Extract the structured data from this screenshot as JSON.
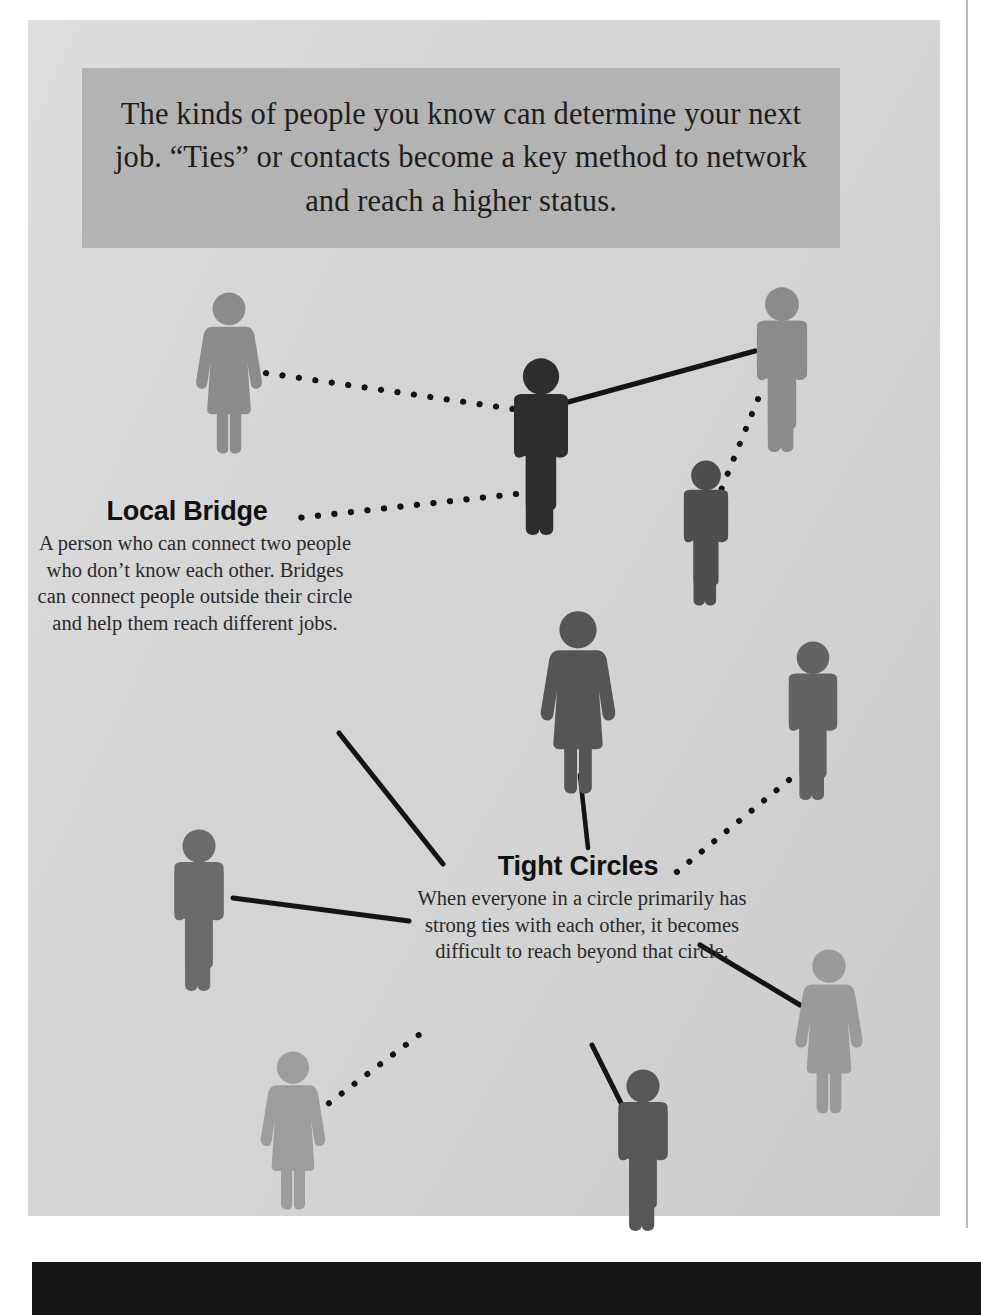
{
  "page": {
    "background_color": "#d4d4d4",
    "accent_band_color": "#b3b3b3",
    "footer_band_color": "#151515"
  },
  "header": {
    "text": "The kinds of people you know can determine your next job. “Ties” or contacts become a key method to network and reach a higher status."
  },
  "callouts": [
    {
      "id": "local-bridge",
      "heading": "Local Bridge",
      "body": "A person who can connect two people who don’t know each other. Bridges can connect people outside their circle and help them reach different jobs."
    },
    {
      "id": "tight-circles",
      "heading": "Tight Circles",
      "body": "When everyone in a circle primarily has strong ties with each other, it becomes difficult to reach beyond that circle."
    }
  ],
  "diagram": {
    "type": "node-link-network",
    "legend": {
      "solid_line": "strong tie",
      "dotted_line": "weak tie"
    },
    "nodes": [
      {
        "id": "n1",
        "gender": "female",
        "x": 229,
        "y": 310,
        "height": 128,
        "color": "#8b8b8b",
        "group": "outside-left"
      },
      {
        "id": "n2",
        "gender": "male",
        "x": 541,
        "y": 385,
        "height": 150,
        "color": "#2e2e2e",
        "group": "bridge"
      },
      {
        "id": "n3",
        "gender": "male",
        "x": 782,
        "y": 303,
        "height": 138,
        "color": "#8b8b8b",
        "group": "upper-right"
      },
      {
        "id": "n4",
        "gender": "male",
        "x": 706,
        "y": 485,
        "height": 120,
        "color": "#4e4e4e",
        "group": "upper-right"
      },
      {
        "id": "n5",
        "gender": "female",
        "x": 578,
        "y": 643,
        "height": 150,
        "color": "#555555",
        "group": "tight-circle"
      },
      {
        "id": "n6",
        "gender": "male",
        "x": 813,
        "y": 667,
        "height": 134,
        "color": "#636363",
        "group": "tight-circle"
      },
      {
        "id": "n7",
        "gender": "male",
        "x": 199,
        "y": 855,
        "height": 136,
        "color": "#6b6b6b",
        "group": "tight-circle"
      },
      {
        "id": "n8",
        "gender": "female",
        "x": 829,
        "y": 975,
        "height": 134,
        "color": "#9a9a9a",
        "group": "tight-circle"
      },
      {
        "id": "n9",
        "gender": "female",
        "x": 293,
        "y": 1076,
        "height": 130,
        "color": "#9d9d9d",
        "group": "outside-bottom"
      },
      {
        "id": "n10",
        "gender": "male",
        "x": 643,
        "y": 1094,
        "height": 136,
        "color": "#575757",
        "group": "tight-circle"
      }
    ],
    "edges": [
      {
        "from": "n1",
        "to": "n2",
        "style": "dotted",
        "tie": "weak"
      },
      {
        "from": "n2",
        "to": "n3",
        "style": "solid",
        "tie": "strong"
      },
      {
        "from": "n3",
        "to": "n4",
        "style": "dotted",
        "tie": "weak"
      },
      {
        "from": "n2",
        "to": "local-bridge-label",
        "style": "dotted",
        "tie": "weak"
      },
      {
        "from": "local-bridge-text",
        "to": "tight-circles-label",
        "style": "solid",
        "tie": "strong"
      },
      {
        "from": "n5",
        "to": "tight-circles-label",
        "style": "solid",
        "tie": "strong"
      },
      {
        "from": "n6",
        "to": "tight-circles-label",
        "style": "dotted",
        "tie": "weak"
      },
      {
        "from": "n7",
        "to": "tight-circles-text",
        "style": "solid",
        "tie": "strong"
      },
      {
        "from": "tight-circles-text",
        "to": "n8",
        "style": "solid",
        "tie": "strong"
      },
      {
        "from": "tight-circles-text",
        "to": "n10",
        "style": "solid",
        "tie": "strong"
      },
      {
        "from": "n9",
        "to": "tight-circles-text",
        "style": "dotted",
        "tie": "weak"
      }
    ]
  }
}
